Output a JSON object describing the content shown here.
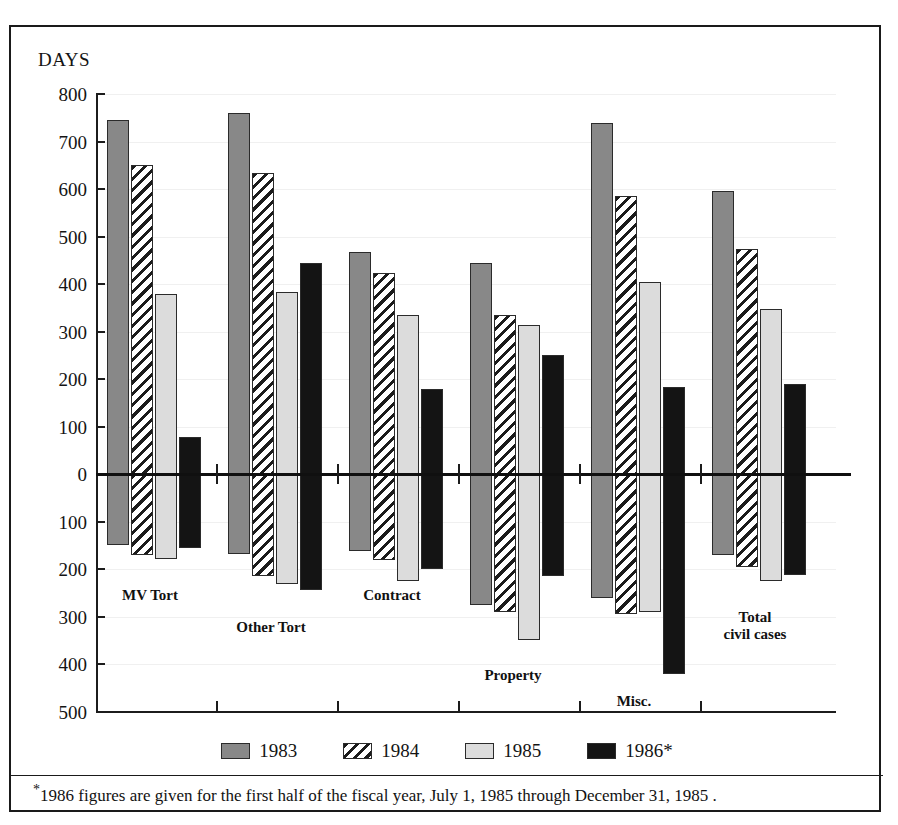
{
  "axis_title": "DAYS",
  "y_axis": {
    "labels_above_zero": [
      "800",
      "700",
      "600",
      "500",
      "400",
      "300",
      "200",
      "100",
      "0"
    ],
    "labels_below_zero": [
      "100",
      "200",
      "300",
      "400",
      "500"
    ],
    "max": 800,
    "min": -500,
    "unit": "days"
  },
  "legend": [
    {
      "label": "1983",
      "swatch": "solid-gray-swatch",
      "color": "#888888"
    },
    {
      "label": "1984",
      "swatch": "diagonal-hatch-swatch",
      "color": "#1b1b1b"
    },
    {
      "label": "1985",
      "swatch": "light-gray-swatch",
      "color": "#dcdcdc"
    },
    {
      "label": "1986*",
      "swatch": "solid-black-swatch",
      "color": "#141414"
    }
  ],
  "footnote": "1986 figures are given for the first half of the fiscal year,  July 1, 1985 through December 31, 1985 .",
  "footnote_marker": "*",
  "chart_data": {
    "type": "bar",
    "title": "",
    "subtitle": "",
    "xlabel": "",
    "ylabel": "DAYS",
    "ylim": [
      -500,
      800
    ],
    "grid": true,
    "legend_position": "bottom",
    "note": "Each category shows a positive bar above the zero line and a negative bar below the zero line for the same year.",
    "categories": [
      "MV Tort",
      "Other Tort",
      "Contract",
      "Property",
      "Misc.",
      "Total civil cases"
    ],
    "series": [
      {
        "name": "1983",
        "positive": [
          745,
          760,
          468,
          445,
          740,
          595
        ],
        "negative": [
          -150,
          -168,
          -162,
          -275,
          -260,
          -170
        ]
      },
      {
        "name": "1984",
        "positive": [
          650,
          633,
          423,
          335,
          585,
          473
        ],
        "negative": [
          -170,
          -215,
          -182,
          -290,
          -295,
          -195
        ]
      },
      {
        "name": "1985",
        "positive": [
          378,
          383,
          335,
          313,
          405,
          347
        ],
        "negative": [
          -178,
          -232,
          -225,
          -350,
          -290,
          -225
        ]
      },
      {
        "name": "1986*",
        "positive": [
          78,
          445,
          178,
          250,
          183,
          190
        ],
        "negative": [
          -155,
          -245,
          -200,
          -215,
          -420,
          -212
        ]
      }
    ]
  }
}
